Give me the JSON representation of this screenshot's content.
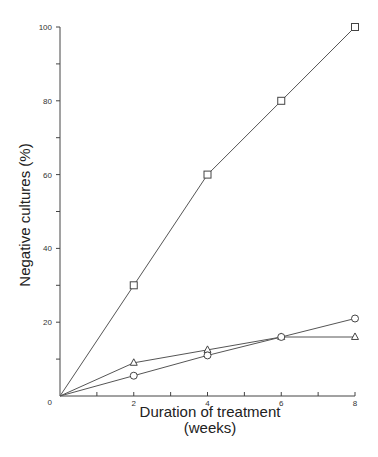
{
  "chart_data": {
    "type": "line",
    "title": "",
    "xlabel": "Duration of treatment",
    "xlabel_line2": "(weeks)",
    "ylabel": "Negative cultures (%)",
    "x": [
      0,
      2,
      4,
      6,
      8
    ],
    "xlim": [
      0,
      8
    ],
    "ylim": [
      0,
      100
    ],
    "x_ticks": [
      0,
      1,
      2,
      3,
      4,
      5,
      6,
      7,
      8
    ],
    "x_tick_labels": [
      "0",
      "",
      "2",
      "",
      "4",
      "",
      "6",
      "",
      "8"
    ],
    "y_ticks": [
      0,
      10,
      20,
      30,
      40,
      50,
      60,
      70,
      80,
      90,
      100
    ],
    "y_tick_labels": [
      "0",
      "",
      "20",
      "",
      "40",
      "",
      "60",
      "",
      "80",
      "",
      "100"
    ],
    "grid": false,
    "legend": null,
    "series": [
      {
        "name": "square",
        "marker": "square",
        "values": [
          0,
          30,
          60,
          80,
          100
        ]
      },
      {
        "name": "triangle",
        "marker": "triangle",
        "values": [
          0,
          9,
          12.5,
          16,
          16
        ]
      },
      {
        "name": "circle",
        "marker": "circle",
        "values": [
          0,
          5.5,
          11,
          16,
          21
        ]
      }
    ]
  }
}
